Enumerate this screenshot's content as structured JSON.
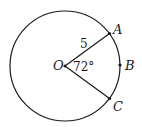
{
  "diagram": {
    "type": "circle-sector",
    "center": {
      "label": "O"
    },
    "points": [
      {
        "label": "A"
      },
      {
        "label": "B"
      },
      {
        "label": "C"
      }
    ],
    "radius_label": "5",
    "angle_label": "72°",
    "colors": {
      "stroke": "#1a1a1a",
      "background": "#ffffff"
    }
  }
}
